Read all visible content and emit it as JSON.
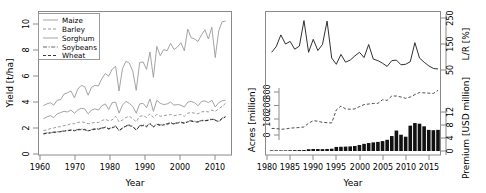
{
  "figure": {
    "panels": [
      "crop-yield-panel",
      "insurance-panel"
    ]
  },
  "chart_data": [
    {
      "type": "line",
      "name": "crop-yield-panel",
      "title": "",
      "xlabel": "Year",
      "ylabel": "Yield [t/ha]",
      "xlim": [
        1960,
        2015
      ],
      "ylim": [
        0,
        11
      ],
      "xticks": [
        1960,
        1970,
        1980,
        1990,
        2000,
        2010
      ],
      "yticks": [
        0,
        2,
        4,
        6,
        8,
        10
      ],
      "grid": false,
      "legend_position": "top-left",
      "legend_entries": [
        "Maize",
        "Barley",
        "Sorghum",
        "Soybeans",
        "Wheat"
      ],
      "x": [
        1961,
        1962,
        1963,
        1964,
        1965,
        1966,
        1967,
        1968,
        1969,
        1970,
        1971,
        1972,
        1973,
        1974,
        1975,
        1976,
        1977,
        1978,
        1979,
        1980,
        1981,
        1982,
        1983,
        1984,
        1985,
        1986,
        1987,
        1988,
        1989,
        1990,
        1991,
        1992,
        1993,
        1994,
        1995,
        1996,
        1997,
        1998,
        1999,
        2000,
        2001,
        2002,
        2003,
        2004,
        2005,
        2006,
        2007,
        2008,
        2009,
        2010,
        2011,
        2012,
        2013,
        2014
      ],
      "series": [
        {
          "name": "Maize",
          "style": "solid",
          "values": [
            3.92,
            4.05,
            4.15,
            3.95,
            4.35,
            4.4,
            4.85,
            4.95,
            5.1,
            4.55,
            5.25,
            5.55,
            5.45,
            4.75,
            5.4,
            5.55,
            5.5,
            6.1,
            6.5,
            6.3,
            6.85,
            7.1,
            5.1,
            6.9,
            7.5,
            7.35,
            6.7,
            5.15,
            7.4,
            7.45,
            6.85,
            8.25,
            6.2,
            8.7,
            7.95,
            8.45,
            8.35,
            8.95,
            8.45,
            8.65,
            9.0,
            8.35,
            10.1,
            9.4,
            9.3,
            9.1,
            9.65,
            10.05,
            9.3,
            10.25,
            7.8,
            9.95,
            10.7,
            10.75
          ]
        },
        {
          "name": "Barley",
          "style": "dashed",
          "values": [
            1.9,
            1.95,
            2.05,
            2.1,
            2.2,
            2.2,
            2.3,
            2.35,
            2.45,
            2.45,
            2.55,
            2.6,
            2.55,
            2.45,
            2.5,
            2.55,
            2.55,
            2.7,
            2.8,
            2.7,
            2.75,
            3.05,
            2.6,
            2.75,
            2.95,
            3.05,
            2.85,
            2.6,
            3.05,
            3.1,
            2.95,
            3.25,
            2.95,
            3.2,
            3.05,
            3.1,
            3.15,
            3.2,
            3.1,
            3.15,
            3.2,
            3.05,
            3.3,
            3.35,
            3.3,
            3.25,
            3.4,
            3.45,
            3.4,
            3.55,
            3.45,
            3.65,
            3.85,
            4.1
          ]
        },
        {
          "name": "Sorghum",
          "style": "solid",
          "values": [
            2.85,
            3.0,
            3.1,
            2.95,
            3.25,
            3.35,
            3.45,
            3.4,
            3.55,
            3.3,
            3.55,
            3.7,
            3.65,
            3.25,
            3.55,
            3.65,
            3.55,
            3.9,
            4.05,
            3.6,
            4.15,
            4.2,
            3.3,
            3.95,
            4.25,
            4.1,
            3.85,
            3.3,
            4.05,
            4.1,
            3.75,
            4.45,
            3.45,
            4.35,
            4.1,
            4.0,
            4.05,
            4.2,
            3.95,
            4.0,
            3.95,
            3.8,
            4.2,
            4.25,
            4.15,
            3.9,
            4.25,
            4.3,
            4.15,
            4.35,
            3.8,
            4.15,
            4.3,
            4.35
          ]
        },
        {
          "name": "Soybeans",
          "style": "dashdot",
          "values": [
            1.65,
            1.7,
            1.72,
            1.78,
            1.8,
            1.82,
            1.88,
            1.9,
            1.95,
            1.92,
            1.98,
            2.02,
            2.0,
            1.85,
            1.98,
            2.05,
            2.05,
            2.1,
            2.2,
            2.05,
            2.15,
            2.28,
            1.85,
            2.1,
            2.3,
            2.35,
            2.25,
            1.9,
            2.3,
            2.35,
            2.25,
            2.5,
            2.2,
            2.45,
            2.35,
            2.4,
            2.45,
            2.55,
            2.45,
            2.55,
            2.6,
            2.5,
            2.65,
            2.7,
            2.65,
            2.6,
            2.75,
            2.7,
            2.75,
            2.85,
            2.75,
            2.65,
            2.9,
            3.05
          ]
        },
        {
          "name": "Wheat",
          "style": "dashed",
          "values": [
            1.62,
            1.68,
            1.7,
            1.74,
            1.78,
            1.8,
            1.85,
            1.88,
            1.92,
            1.88,
            1.95,
            1.98,
            1.96,
            1.88,
            1.94,
            2.0,
            2.0,
            2.08,
            2.15,
            2.02,
            2.12,
            2.22,
            1.92,
            2.08,
            2.25,
            2.3,
            2.2,
            1.95,
            2.25,
            2.3,
            2.2,
            2.45,
            2.18,
            2.4,
            2.3,
            2.35,
            2.4,
            2.5,
            2.42,
            2.5,
            2.55,
            2.48,
            2.6,
            2.65,
            2.6,
            2.58,
            2.7,
            2.68,
            2.72,
            2.8,
            2.72,
            2.62,
            2.85,
            3.0
          ]
        }
      ]
    },
    {
      "type": "line",
      "name": "insurance-panel",
      "title": "",
      "xlabel": "Year",
      "ylabel_left": "Acres [million]",
      "ylabel_right_upper": "L/R [%]",
      "ylabel_right_lower": "Premium [USD million]",
      "xlim": [
        1980,
        2017
      ],
      "xticks": [
        1980,
        1985,
        1990,
        1995,
        2000,
        2005,
        2010,
        2015
      ],
      "yticks_left": [
        0,
        100,
        200,
        300
      ],
      "yticks_right_upper": [
        50,
        150,
        250
      ],
      "yticks_right_lower": [
        0,
        4,
        8,
        12
      ],
      "grid": false,
      "x": [
        1981,
        1982,
        1983,
        1984,
        1985,
        1986,
        1987,
        1988,
        1989,
        1990,
        1991,
        1992,
        1993,
        1994,
        1995,
        1996,
        1997,
        1998,
        1999,
        2000,
        2001,
        2002,
        2003,
        2004,
        2005,
        2006,
        2007,
        2008,
        2009,
        2010,
        2011,
        2012,
        2013,
        2014,
        2015,
        2016,
        2017
      ],
      "series": [
        {
          "name": "Loss Ratio",
          "style": "solid",
          "axis": "right-upper",
          "units": "%",
          "values": [
            118,
            140,
            185,
            150,
            160,
            130,
            142,
            240,
            118,
            168,
            125,
            148,
            238,
            96,
            72,
            110,
            80,
            88,
            104,
            118,
            98,
            148,
            92,
            86,
            76,
            64,
            86,
            88,
            70,
            72,
            82,
            155,
            96,
            80,
            66,
            56,
            54
          ]
        },
        {
          "name": "Acres Insured",
          "style": "dashed",
          "axis": "left",
          "units": "million",
          "values": [
            46,
            45,
            40,
            42,
            48,
            50,
            52,
            56,
            82,
            100,
            96,
            88,
            86,
            84,
            175,
            202,
            182,
            180,
            182,
            198,
            212,
            216,
            220,
            221,
            246,
            242,
            272,
            272,
            265,
            256,
            265,
            282,
            296,
            294,
            292,
            290,
            312
          ]
        },
        {
          "name": "Premium",
          "style": "bar",
          "axis": "right-lower",
          "units": "USD million",
          "values": [
            0.15,
            0.15,
            0.18,
            0.18,
            0.22,
            0.25,
            0.28,
            0.3,
            0.55,
            0.62,
            0.6,
            0.58,
            0.62,
            0.7,
            1.25,
            1.3,
            1.35,
            1.42,
            1.55,
            1.85,
            2.2,
            2.45,
            2.65,
            2.8,
            3.05,
            3.45,
            4.6,
            6.3,
            5.0,
            4.4,
            7.8,
            8.6,
            8.4,
            7.6,
            6.5,
            6.4,
            6.5
          ]
        }
      ]
    }
  ]
}
